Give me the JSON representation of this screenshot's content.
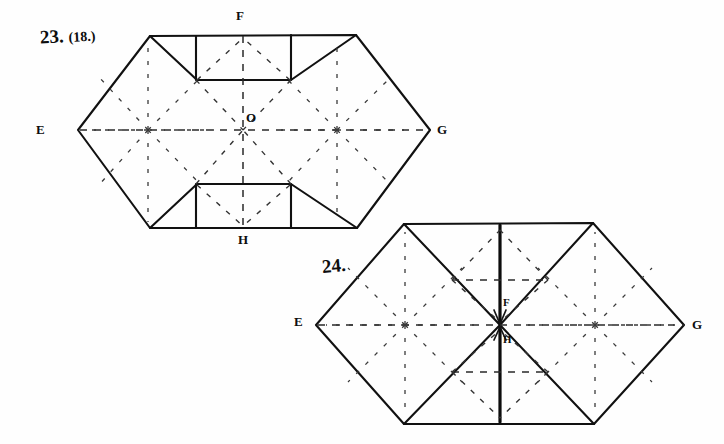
{
  "page": {
    "background_color": "#fefefe",
    "ink_color": "#111111",
    "width": 724,
    "height": 444
  },
  "figures": [
    {
      "id": "figure-23",
      "number_label": "23.",
      "alt_number_label": "(18.)",
      "description": "Hexagonal crease pattern with rectangular flaps top and bottom and radial star creases",
      "vertex_labels": [
        {
          "name": "E",
          "text": "E",
          "x": 36,
          "y": 122
        },
        {
          "name": "G",
          "text": "G",
          "x": 437,
          "y": 122
        },
        {
          "name": "F",
          "text": "F",
          "x": 236,
          "y": 8
        },
        {
          "name": "H",
          "text": "H",
          "x": 238,
          "y": 232
        },
        {
          "name": "O",
          "text": "O",
          "x": 246,
          "y": 110
        }
      ],
      "geometry": {
        "hex_left_x": 78,
        "hex_right_x": 430,
        "hex_top_y": 35,
        "hex_bottom_y": 228,
        "hex_mid_y": 130,
        "top_flap": {
          "left": 196,
          "right": 291,
          "top": 35,
          "bottom": 80
        },
        "bottom_flap": {
          "left": 196,
          "right": 291,
          "top": 184,
          "bottom": 228
        },
        "star_centers": [
          {
            "x": 148,
            "y": 130
          },
          {
            "x": 337,
            "y": 130
          }
        ]
      }
    },
    {
      "id": "figure-24",
      "number_label": "24.",
      "alt_number_label": "",
      "description": "Hexagonal crease pattern with inward triangular folds meeting at center point",
      "vertex_labels": [
        {
          "name": "E",
          "text": "E",
          "x": 294,
          "y": 314
        },
        {
          "name": "G",
          "text": "G",
          "x": 692,
          "y": 317
        },
        {
          "name": "F",
          "text": "F",
          "x": 503,
          "y": 296
        },
        {
          "name": "H",
          "text": "H",
          "x": 503,
          "y": 333
        }
      ],
      "geometry": {
        "hex_left_x": 316,
        "hex_right_x": 684,
        "hex_top_y": 223,
        "hex_bottom_y": 424,
        "hex_mid_y": 325,
        "center_x": 500,
        "star_centers": [
          {
            "x": 405,
            "y": 325
          },
          {
            "x": 595,
            "y": 325
          }
        ],
        "upper_dash_y": 280,
        "lower_dash_y": 372
      }
    }
  ],
  "legend": {
    "solid_line_meaning": "cut or visible edge",
    "dashed_line_meaning": "fold crease",
    "bold_line_meaning": "emphasized valley fold"
  }
}
